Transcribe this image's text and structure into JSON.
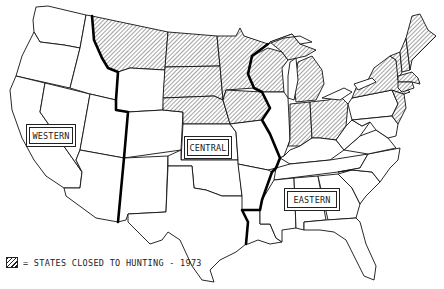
{
  "map": {
    "type": "map",
    "subject": "United States waterfowl flyway regions",
    "regions": [
      {
        "label": "WESTERN"
      },
      {
        "label": "CENTRAL"
      },
      {
        "label": "EASTERN"
      }
    ],
    "legend": {
      "symbol": "hatched-pattern",
      "text": "= STATES CLOSED TO HUNTING - 1973"
    },
    "closed_states": [
      "Montana",
      "North Dakota",
      "South Dakota",
      "Nebraska",
      "Minnesota",
      "Iowa",
      "Wisconsin",
      "Michigan",
      "Indiana",
      "Ohio",
      "New York",
      "Vermont",
      "New Hampshire",
      "Maine",
      "Massachusetts",
      "Connecticut",
      "Rhode Island",
      "New Jersey"
    ],
    "colors": {
      "line": "#111111",
      "background": "#ffffff"
    }
  }
}
